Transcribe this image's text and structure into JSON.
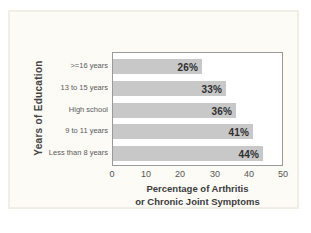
{
  "chart_data": {
    "type": "bar",
    "orientation": "horizontal",
    "categories": [
      ">=16 years",
      "13 to 15 years",
      "High school",
      "9 to 11 years",
      "Less than 8 years"
    ],
    "values": [
      26,
      33,
      36,
      41,
      44
    ],
    "value_labels": [
      "26%",
      "33%",
      "36%",
      "41%",
      "44%"
    ],
    "x_ticks": [
      "0",
      "10",
      "20",
      "30",
      "40",
      "50"
    ],
    "xlim": [
      0,
      50
    ],
    "xlabel_line1": "Percentage of Arthritis",
    "xlabel_line2": "or Chronic Joint Symptoms",
    "ylabel": "Years of Education",
    "grid": false,
    "legend": "none",
    "bar_color": "#c8c8c8",
    "bar_label_color": "#2f2f2f",
    "panel_background": "#fcfbf6",
    "plot_background": "#ffffff"
  }
}
